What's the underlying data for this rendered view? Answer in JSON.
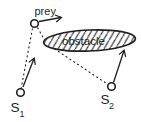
{
  "figure": {
    "type": "diagram",
    "labels": {
      "prey": "prey",
      "obstacle": "obstacle",
      "s1_base": "S",
      "s1_sub": "1",
      "s2_base": "S",
      "s2_sub": "2"
    },
    "colors": {
      "ink": "#1f1f1f",
      "background": "#ffffff"
    },
    "elements": {
      "nodes": [
        {
          "id": "prey",
          "shape": "open-circle",
          "has_velocity_arrow": true
        },
        {
          "id": "S1",
          "shape": "open-circle",
          "has_velocity_arrow": true
        },
        {
          "id": "S2",
          "shape": "open-circle",
          "has_velocity_arrow": true
        }
      ],
      "obstacle": {
        "shape": "ellipse",
        "fill": "diagonal-hatching"
      },
      "dashed_lines": [
        {
          "from": "S1",
          "to": "prey",
          "style": "dashed",
          "note": "direct line of sight"
        },
        {
          "from": "prey",
          "to": "S2",
          "style": "dashed",
          "note": "sight line interrupted at obstacle lower-left edge"
        }
      ]
    }
  }
}
